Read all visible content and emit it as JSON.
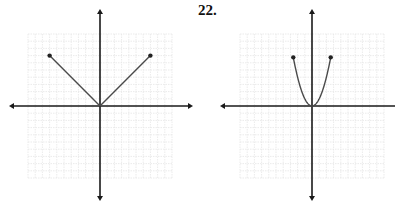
{
  "problem": {
    "label": "22."
  },
  "colors": {
    "axis": "#1a1a1a",
    "curve": "#4a4a4a",
    "point": "#222222",
    "grid": "#e6e6e6"
  },
  "chart_data": [
    {
      "type": "line",
      "title": "",
      "description": "Absolute value graph y = |x| with closed endpoints",
      "xlabel": "",
      "ylabel": "",
      "xlim": [
        -10,
        10
      ],
      "ylim": [
        -10,
        10
      ],
      "grid": true,
      "axes_arrows": true,
      "series": [
        {
          "name": "y = |x|",
          "x": [
            -7,
            0,
            7
          ],
          "y": [
            7,
            0,
            7
          ],
          "endpoints": [
            [
              -7,
              7
            ],
            [
              7,
              7
            ]
          ]
        }
      ]
    },
    {
      "type": "line",
      "title": "22.",
      "description": "Parabola y = x^2 with closed endpoints",
      "xlabel": "",
      "ylabel": "",
      "xlim": [
        -10,
        10
      ],
      "ylim": [
        -10,
        10
      ],
      "grid": true,
      "axes_arrows": true,
      "series": [
        {
          "name": "y = x^2",
          "x": [
            -2.6,
            -2,
            -1.5,
            -1,
            -0.5,
            0,
            0.5,
            1,
            1.5,
            2,
            2.6
          ],
          "y": [
            6.76,
            4,
            2.25,
            1,
            0.25,
            0,
            0.25,
            1,
            2.25,
            4,
            6.76
          ],
          "endpoints": [
            [
              -2.6,
              6.76
            ],
            [
              2.6,
              6.76
            ]
          ]
        }
      ]
    }
  ],
  "layout": {
    "graphs": [
      {
        "origin": [
          100,
          106
        ],
        "unit": 7.2,
        "grid_box": [
          28,
          34,
          172,
          178
        ],
        "x_axis": [
          9,
          193
        ],
        "y_axis": [
          9,
          201
        ],
        "x_axis_right_arrow": true
      },
      {
        "origin": [
          312,
          106
        ],
        "unit": 7.2,
        "grid_box": [
          240,
          34,
          384,
          178
        ],
        "x_axis": [
          220,
          395
        ],
        "y_axis": [
          9,
          201
        ],
        "x_axis_right_arrow": false
      }
    ]
  }
}
